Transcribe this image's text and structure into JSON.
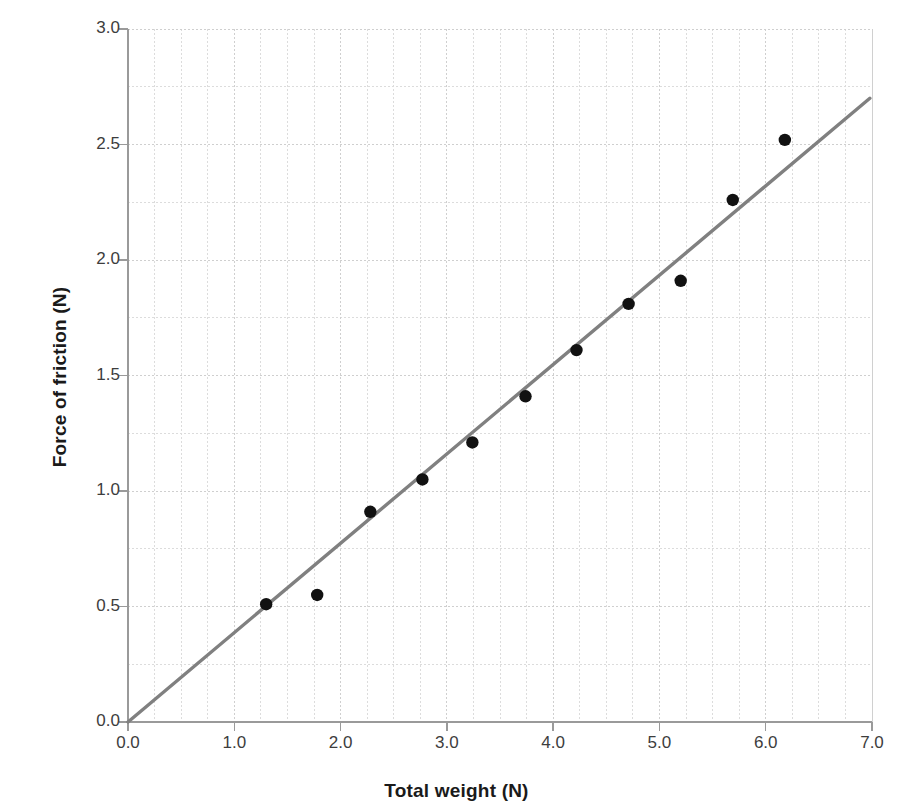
{
  "chart_data": {
    "type": "scatter",
    "title": "",
    "xlabel": "Total weight (N)",
    "ylabel": "Force of friction (N)",
    "xlim": [
      0.0,
      7.0
    ],
    "ylim": [
      0.0,
      3.0
    ],
    "xticks": [
      "0.0",
      "1.0",
      "2.0",
      "3.0",
      "4.0",
      "5.0",
      "6.0",
      "7.0"
    ],
    "ytick_values": [
      0.0,
      0.5,
      1.0,
      1.5,
      2.0,
      2.5,
      3.0
    ],
    "yticks": [
      "0.0",
      "0.5",
      "1.0",
      "1.5",
      "2.0",
      "2.5",
      "3.0"
    ],
    "xtick_values": [
      0.0,
      1.0,
      2.0,
      3.0,
      4.0,
      5.0,
      6.0,
      7.0
    ],
    "grid": true,
    "grid_minor_step_x": 0.25,
    "grid_minor_step_y": 0.25,
    "grid_color": "#d8d8d8",
    "legend": "none",
    "series": [
      {
        "name": "Measured data",
        "type": "scatter",
        "marker": "circle",
        "color": "#111111",
        "points": [
          {
            "x": 1.3,
            "y": 0.51
          },
          {
            "x": 1.78,
            "y": 0.55
          },
          {
            "x": 2.28,
            "y": 0.91
          },
          {
            "x": 2.77,
            "y": 1.05
          },
          {
            "x": 3.24,
            "y": 1.21
          },
          {
            "x": 3.74,
            "y": 1.41
          },
          {
            "x": 4.22,
            "y": 1.61
          },
          {
            "x": 4.71,
            "y": 1.81
          },
          {
            "x": 5.2,
            "y": 1.91
          },
          {
            "x": 5.69,
            "y": 2.26
          },
          {
            "x": 6.18,
            "y": 2.52
          }
        ]
      },
      {
        "name": "Trend line",
        "type": "line",
        "color": "#808080",
        "slope": 0.387,
        "intercept": 0.0,
        "points": [
          {
            "x": 0.0,
            "y": 0.0
          },
          {
            "x": 6.98,
            "y": 2.7
          }
        ]
      }
    ]
  },
  "axes": {
    "axis_color": "#9a9a9a",
    "tick_color": "#9a9a9a"
  }
}
